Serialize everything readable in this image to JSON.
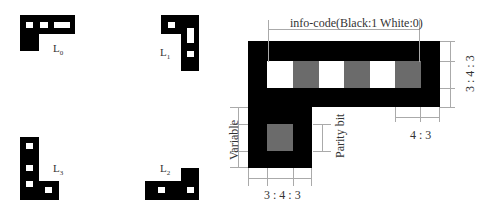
{
  "shapes": {
    "L0": {
      "label": "L",
      "sub": "0"
    },
    "L1": {
      "label": "L",
      "sub": "1"
    },
    "L3": {
      "label": "L",
      "sub": "3"
    },
    "L2": {
      "label": "L",
      "sub": "2"
    }
  },
  "main": {
    "info_code_label": "info-code(Black:1 White:0)",
    "right_ratio": "3 : 4 : 3",
    "variable_label": "Variable",
    "parity_label": "Parity bit",
    "bottom_ratio": "3 : 4 : 3",
    "cell_ratio": "4 : 3",
    "colors": {
      "black": "#000000",
      "white": "#ffffff",
      "gray": "#6b6b6b"
    }
  }
}
